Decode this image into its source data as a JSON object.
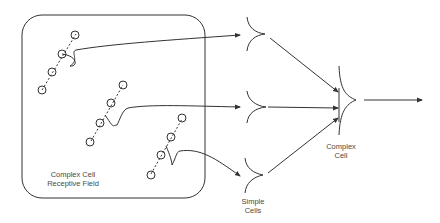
{
  "diagram": {
    "receptive_field_label": [
      "Complex Cell",
      "Receptive Field"
    ],
    "simple_cells_label": [
      "Simple",
      "Cells"
    ],
    "complex_cell_label": [
      "Complex",
      "Cell"
    ],
    "colors": {
      "line": "#333333",
      "text": "#4a4a4a",
      "background": "#ffffff"
    }
  }
}
